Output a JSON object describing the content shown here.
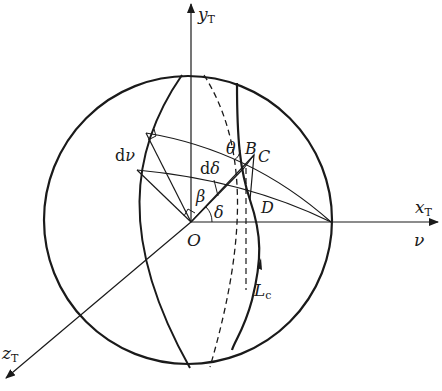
{
  "figure": {
    "type": "spherical geometry diagram",
    "stroke_color": "#1a1a1a",
    "background": "#ffffff"
  },
  "labels": {
    "y_axis": "y",
    "y_axis_sub": "T",
    "x_axis": "x",
    "x_axis_sub": "T",
    "z_axis": "z",
    "z_axis_sub": "T",
    "nu_axis": "ν",
    "origin": "O",
    "point_b": "B",
    "point_c": "C",
    "point_d": "D",
    "theta": "θ",
    "beta": "β",
    "delta": "δ",
    "d_delta_prefix": "d",
    "d_delta_symbol": "δ",
    "d_nu_prefix": "d",
    "d_nu_symbol": "ν",
    "curve": "L",
    "curve_sub": "c"
  }
}
